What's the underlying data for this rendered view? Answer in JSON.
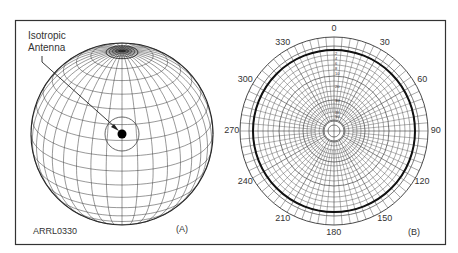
{
  "figure": {
    "id_label": "ARRL0330",
    "panel_a": {
      "label": "(A)",
      "callout": [
        "Isotropic",
        "Antenna"
      ],
      "description": "Sphere with latitude/longitude grid and isotropic antenna point at center"
    },
    "panel_b": {
      "label": "(B)",
      "description": "Polar plot with uniform circular pattern",
      "angle_labels": [
        {
          "text": "0",
          "angle": 0
        },
        {
          "text": "30",
          "angle": 30
        },
        {
          "text": "60",
          "angle": 60
        },
        {
          "text": "90",
          "angle": 90
        },
        {
          "text": "120",
          "angle": 120
        },
        {
          "text": "150",
          "angle": 150
        },
        {
          "text": "180",
          "angle": 180
        },
        {
          "text": "210",
          "angle": 210
        },
        {
          "text": "240",
          "angle": 240
        },
        {
          "text": "270",
          "angle": 270
        },
        {
          "text": "300",
          "angle": 300
        },
        {
          "text": "330",
          "angle": 330
        }
      ],
      "radial_labels": [
        "2",
        "4",
        "6",
        "8",
        "10",
        "20",
        "30",
        "40",
        "50"
      ]
    },
    "colors": {
      "frame": "#333333",
      "grid": "#555555",
      "pattern": "#111111",
      "background": "#ffffff"
    }
  }
}
